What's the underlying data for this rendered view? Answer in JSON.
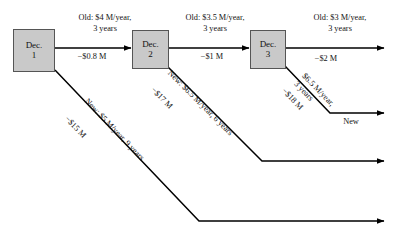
{
  "diagram": {
    "type": "decision-tree",
    "background_color": "#ffffff",
    "node_fill_color": "#c9c9c9",
    "node_border_color": "#555555",
    "line_color": "#000000"
  },
  "nodes": [
    {
      "id": "dec1",
      "line1": "Dec.",
      "line2": "1",
      "x": 13,
      "y": 29,
      "w": 42,
      "h": 43
    },
    {
      "id": "dec2",
      "line1": "Dec.",
      "line2": "2",
      "x": 132,
      "y": 30,
      "w": 37,
      "h": 39
    },
    {
      "id": "dec3",
      "line1": "Dec.",
      "line2": "3",
      "x": 250,
      "y": 30,
      "w": 36,
      "h": 39
    }
  ],
  "branch_labels": {
    "old1_line1": "Old: $4 M/year,",
    "old1_line2": "3 years",
    "cost1": "−$0.8 M",
    "old2_line1": "Old: $3.5 M/year,",
    "old2_line2": "3 years",
    "cost2": "−$1 M",
    "old3_line1": "Old: $3 M/year,",
    "old3_line2": "3 years",
    "cost3": "−$2 M",
    "new1_top": "New: $5 M/year, 9 years",
    "new1_bottom": "−$15 M",
    "new2_top": "New: $6.5 M/year, 6 years",
    "new2_bottom": "−$17 M",
    "new3_top": "$6.5 M/year,",
    "new3_top2": "3 years",
    "new3_bottom": "−$18 M",
    "new3_end": "New"
  }
}
